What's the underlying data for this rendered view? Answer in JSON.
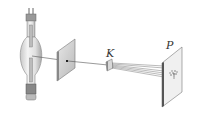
{
  "diagram": {
    "labels": {
      "crystal": "K",
      "screen": "P"
    },
    "components": [
      {
        "id": "x-ray-tube",
        "desc": "X-ray tube"
      },
      {
        "id": "aperture-plate",
        "desc": "Plate with pinhole"
      },
      {
        "id": "crystal",
        "desc": "Crystal K"
      },
      {
        "id": "screen",
        "desc": "Photographic plate P"
      }
    ]
  }
}
